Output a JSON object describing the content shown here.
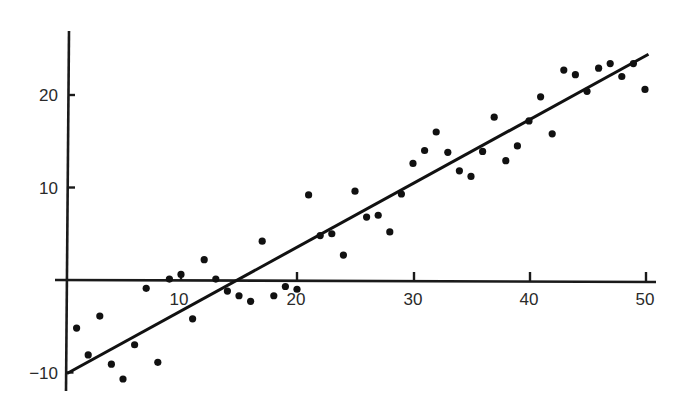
{
  "chart_data": {
    "type": "scatter",
    "title": "",
    "xlabel": "",
    "ylabel": "",
    "xlim": [
      0,
      51
    ],
    "ylim": [
      -12,
      27
    ],
    "grid": false,
    "legend": null,
    "x_ticks": [
      10,
      20,
      30,
      40,
      50
    ],
    "x_tick_labels": [
      "10",
      "20",
      "30",
      "40",
      "50"
    ],
    "y_ticks": [
      -10,
      10,
      20
    ],
    "y_tick_labels": [
      "−10",
      "10",
      "20"
    ],
    "points": [
      {
        "x": 1,
        "y": -5.2
      },
      {
        "x": 2,
        "y": -8.1
      },
      {
        "x": 3,
        "y": -3.9
      },
      {
        "x": 4,
        "y": -9.1
      },
      {
        "x": 5,
        "y": -10.7
      },
      {
        "x": 6,
        "y": -7.0
      },
      {
        "x": 7,
        "y": -0.9
      },
      {
        "x": 8,
        "y": -8.9
      },
      {
        "x": 9,
        "y": 0.1
      },
      {
        "x": 10,
        "y": 0.6
      },
      {
        "x": 11,
        "y": -4.2
      },
      {
        "x": 12,
        "y": 2.2
      },
      {
        "x": 13,
        "y": 0.1
      },
      {
        "x": 14,
        "y": -1.2
      },
      {
        "x": 15,
        "y": -1.7
      },
      {
        "x": 16,
        "y": -2.3
      },
      {
        "x": 17,
        "y": 4.2
      },
      {
        "x": 18,
        "y": -1.7
      },
      {
        "x": 19,
        "y": -0.7
      },
      {
        "x": 20,
        "y": -1.0
      },
      {
        "x": 21,
        "y": 9.2
      },
      {
        "x": 22,
        "y": 4.8
      },
      {
        "x": 23,
        "y": 5.0
      },
      {
        "x": 24,
        "y": 2.7
      },
      {
        "x": 25,
        "y": 9.6
      },
      {
        "x": 26,
        "y": 6.8
      },
      {
        "x": 27,
        "y": 7.0
      },
      {
        "x": 28,
        "y": 5.2
      },
      {
        "x": 29,
        "y": 9.3
      },
      {
        "x": 30,
        "y": 12.6
      },
      {
        "x": 31,
        "y": 14.0
      },
      {
        "x": 32,
        "y": 16.0
      },
      {
        "x": 33,
        "y": 13.8
      },
      {
        "x": 34,
        "y": 11.8
      },
      {
        "x": 35,
        "y": 11.2
      },
      {
        "x": 36,
        "y": 13.9
      },
      {
        "x": 37,
        "y": 17.6
      },
      {
        "x": 38,
        "y": 12.9
      },
      {
        "x": 39,
        "y": 14.5
      },
      {
        "x": 40,
        "y": 17.2
      },
      {
        "x": 41,
        "y": 19.8
      },
      {
        "x": 42,
        "y": 15.8
      },
      {
        "x": 43,
        "y": 22.7
      },
      {
        "x": 44,
        "y": 22.2
      },
      {
        "x": 45,
        "y": 20.4
      },
      {
        "x": 46,
        "y": 22.9
      },
      {
        "x": 47,
        "y": 23.4
      },
      {
        "x": 48,
        "y": 22.0
      },
      {
        "x": 49,
        "y": 23.4
      },
      {
        "x": 50,
        "y": 20.6
      }
    ],
    "fit_line": {
      "x0": 0,
      "y0": -10,
      "x1": 50.3,
      "y1": 24.4,
      "slope": 0.69,
      "intercept": -10
    },
    "colors": {
      "points": "#111111",
      "line": "#111111",
      "axes": "#1a1a1a",
      "background": "#ffffff"
    }
  }
}
